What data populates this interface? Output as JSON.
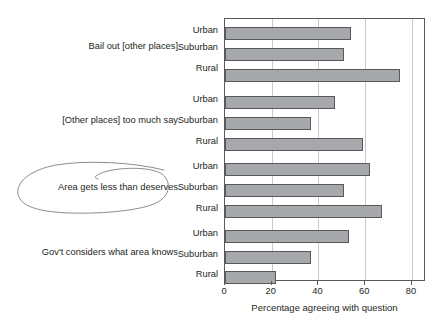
{
  "chart_data": {
    "type": "bar",
    "orientation": "horizontal",
    "title": "",
    "subtitle": "",
    "xlabel": "Percentage agreeing with question",
    "ylabel": "",
    "xlim": [
      0,
      86
    ],
    "xticks": [
      0,
      20,
      40,
      60,
      80
    ],
    "xtick_labels": [
      "0",
      "20",
      "40",
      "60",
      "80"
    ],
    "grid": "vertical",
    "legend": "none",
    "categories": [
      "Urban",
      "Suburban",
      "Rural"
    ],
    "groups": [
      {
        "label": "Bail out [other places]",
        "bars": [
          {
            "category": "Urban",
            "value": 54
          },
          {
            "category": "Suburban",
            "value": 51
          },
          {
            "category": "Rural",
            "value": 75
          }
        ]
      },
      {
        "label": "[Other places] too much say",
        "bars": [
          {
            "category": "Urban",
            "value": 47
          },
          {
            "category": "Suburban",
            "value": 37
          },
          {
            "category": "Rural",
            "value": 59
          }
        ]
      },
      {
        "label": "Area gets less than deserves",
        "bars": [
          {
            "category": "Urban",
            "value": 62
          },
          {
            "category": "Suburban",
            "value": 51
          },
          {
            "category": "Rural",
            "value": 67
          }
        ]
      },
      {
        "label": "Gov't considers what area knows",
        "bars": [
          {
            "category": "Urban",
            "value": 53
          },
          {
            "category": "Suburban",
            "value": 37
          },
          {
            "category": "Rural",
            "value": 22
          }
        ]
      }
    ],
    "annotations": [
      {
        "name": "hand-drawn-ellipse",
        "target": "Area gets less than deserves",
        "shape": "ellipse",
        "color": "#8c8c8c"
      }
    ],
    "colors": {
      "bar_fill": "#a6a8ab",
      "bar_border": "#58595b",
      "gridline": "#c9cacc",
      "axis": "#58595b",
      "text": "#231f20",
      "background": "#ffffff"
    }
  },
  "labels": {
    "group_0": "Bail out [other places]",
    "group_1": "[Other places] too much say",
    "group_2": "Area gets less than deserves",
    "group_3": "Gov't considers what area knows",
    "urban": "Urban",
    "suburban": "Suburban",
    "rural": "Rural",
    "x_axis_title": "Percentage agreeing with question",
    "tick_0": "0",
    "tick_20": "20",
    "tick_40": "40",
    "tick_60": "60",
    "tick_80": "80"
  }
}
